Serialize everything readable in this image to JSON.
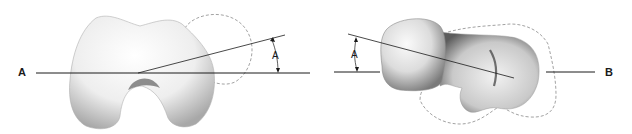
{
  "figure": {
    "left_view": {
      "axis_label": "A",
      "angle_label": "A"
    },
    "right_view": {
      "axis_label": "B",
      "angle_label": "A"
    },
    "colors": {
      "line": "#1a1a1a",
      "dashed_outline": "#8a8a8a",
      "bone_fill": "#f4f4f4",
      "bone_shade": "#9a9a9a"
    }
  }
}
